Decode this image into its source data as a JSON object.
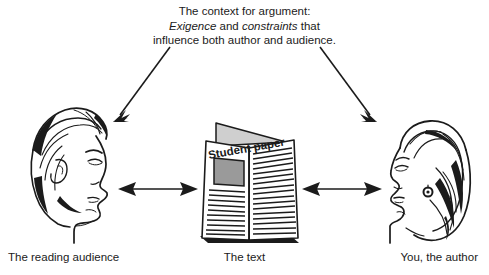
{
  "figure": {
    "background_color": "#ffffff",
    "ink_color": "#1b1b1b",
    "caption": {
      "line1": "The context for argument:",
      "line2_italic_a": "Exigence",
      "line2_plain_a": " and ",
      "line2_italic_b": "constraints",
      "line2_plain_b": " that",
      "line3": "influence both author and audience."
    },
    "nodes": {
      "left": {
        "label": "The reading audience",
        "icon": "man-head-profile-facing-right"
      },
      "center": {
        "label": "The text",
        "icon": "folded-student-paper",
        "headline": "Student paper",
        "photo_block_color": "#9a9a9a"
      },
      "right": {
        "label": "You, the author",
        "icon": "woman-head-profile-facing-left"
      }
    },
    "arrows": {
      "context_to_audience": "diagonal-arrow-down-left",
      "context_to_author": "diagonal-arrow-down-right",
      "audience_text": "double-headed-arrow-horizontal",
      "text_author": "double-headed-arrow-horizontal"
    }
  }
}
